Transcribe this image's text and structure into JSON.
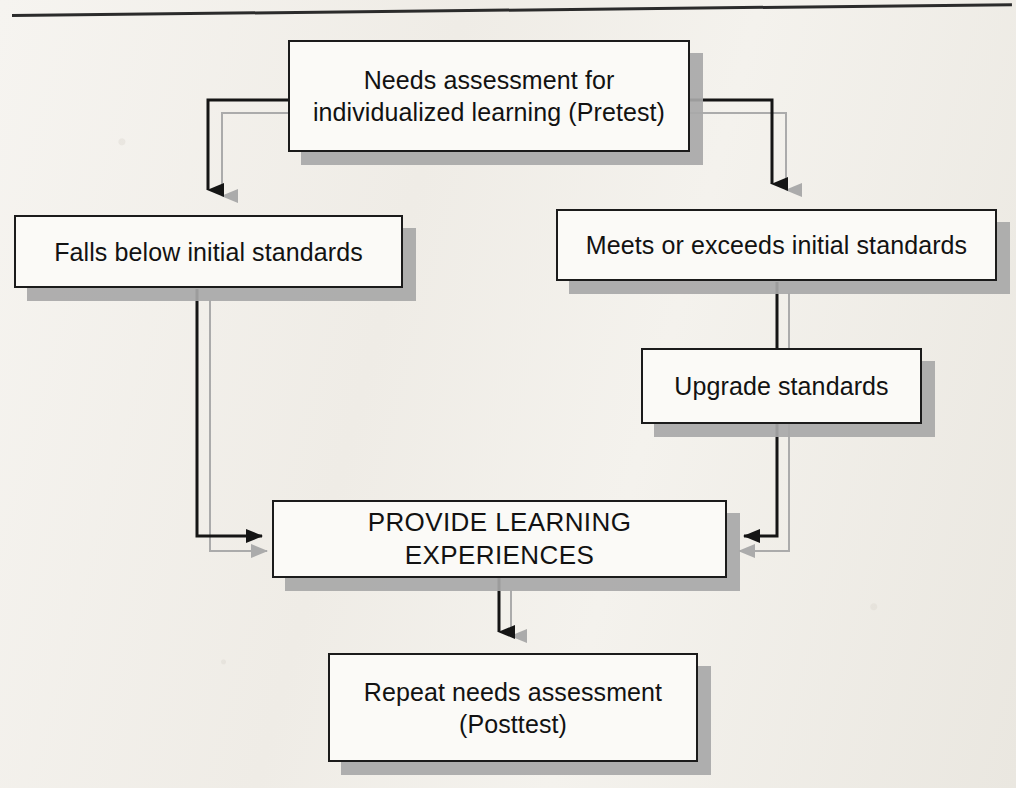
{
  "figure": {
    "type": "flowchart",
    "orientation": "top-down",
    "style": {
      "node_fill": "#fbfaf7",
      "node_border": "#1b1b1b",
      "node_shadow": "#a8a8a8",
      "connector": "#1b1b1b",
      "connector_ghost": "#a8a8a8",
      "page_background": "#f2efe9"
    },
    "top_rule": true
  },
  "nodes": [
    {
      "id": "pretest",
      "label": "Needs assessment for\nindividualized learning (Pretest)",
      "x": 288,
      "y": 40,
      "w": 402,
      "h": 112
    },
    {
      "id": "falls_below",
      "label": "Falls below initial standards",
      "x": 14,
      "y": 215,
      "w": 389,
      "h": 73
    },
    {
      "id": "meets_exceeds",
      "label": "Meets or exceeds initial standards",
      "x": 556,
      "y": 209,
      "w": 441,
      "h": 72
    },
    {
      "id": "upgrade",
      "label": "Upgrade standards",
      "x": 641,
      "y": 348,
      "w": 281,
      "h": 76
    },
    {
      "id": "provide",
      "label": "PROVIDE LEARNING EXPERIENCES",
      "x": 272,
      "y": 500,
      "w": 455,
      "h": 78
    },
    {
      "id": "posttest",
      "label": "Repeat needs assessment\n(Posttest)",
      "x": 328,
      "y": 653,
      "w": 370,
      "h": 109
    }
  ],
  "edges": [
    {
      "id": "pretest-to-falls",
      "from": "pretest",
      "to": "falls_below",
      "arrow": "down"
    },
    {
      "id": "pretest-to-meets",
      "from": "pretest",
      "to": "meets_exceeds",
      "arrow": "down"
    },
    {
      "id": "falls-to-provide",
      "from": "falls_below",
      "to": "provide",
      "arrow": "right"
    },
    {
      "id": "meets-to-upgrade",
      "from": "meets_exceeds",
      "to": "upgrade",
      "arrow": "down"
    },
    {
      "id": "upgrade-to-provide",
      "from": "upgrade",
      "to": "provide",
      "arrow": "left"
    },
    {
      "id": "provide-to-posttest",
      "from": "provide",
      "to": "posttest",
      "arrow": "down"
    }
  ]
}
